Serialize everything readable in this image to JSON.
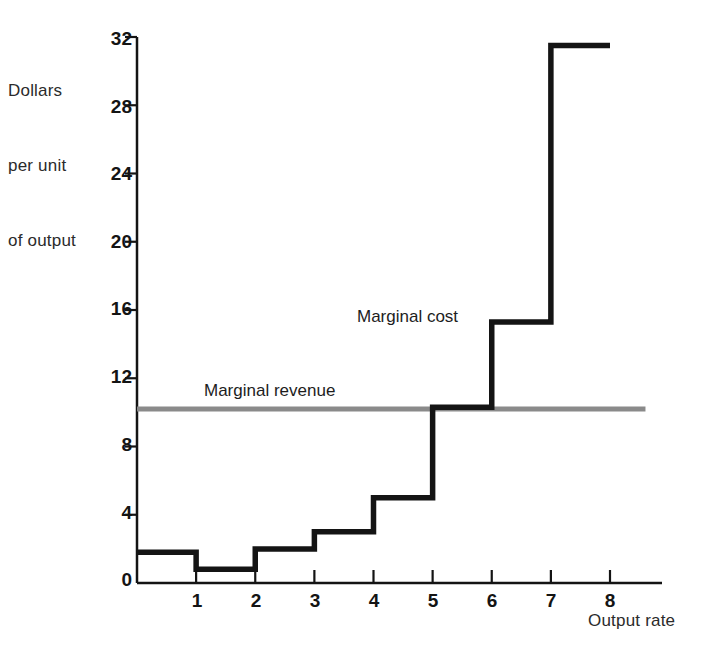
{
  "figure": {
    "background": "#ffffff",
    "ink": "#141414",
    "revenue_color": "#8a8a8a"
  },
  "axes": {
    "y_title_lines": [
      "Dollars",
      "per unit",
      "of output"
    ],
    "x_title": "Output rate",
    "y_ticks": [
      0,
      4,
      8,
      12,
      16,
      20,
      24,
      28,
      32
    ],
    "y_tick_labels": [
      "0",
      "4",
      "8",
      "12",
      "16",
      "20",
      "24",
      "28",
      "32"
    ],
    "x_ticks": [
      1,
      2,
      3,
      4,
      5,
      6,
      7,
      8
    ],
    "x_tick_labels": [
      "1",
      "2",
      "3",
      "4",
      "5",
      "6",
      "7",
      "8"
    ],
    "ylim": [
      0,
      32
    ],
    "xlim": [
      0,
      8.6
    ],
    "grid": "off"
  },
  "annotations": {
    "marginal_cost": "Marginal cost",
    "marginal_revenue": "Marginal revenue"
  },
  "chart_data": {
    "type": "line",
    "title": "",
    "xlabel": "Output rate",
    "ylabel": "Dollars per unit of output",
    "xlim": [
      0,
      8.6
    ],
    "ylim": [
      0,
      32
    ],
    "grid": "off",
    "legend_position": "inline-annotations",
    "series": [
      {
        "name": "Marginal cost",
        "style": "step",
        "color": "#141414",
        "intervals": [
          {
            "from": 0,
            "to": 1,
            "value": 1.8
          },
          {
            "from": 1,
            "to": 2,
            "value": 0.8
          },
          {
            "from": 2,
            "to": 3,
            "value": 2.0
          },
          {
            "from": 3,
            "to": 4,
            "value": 3.0
          },
          {
            "from": 4,
            "to": 5,
            "value": 5.0
          },
          {
            "from": 5,
            "to": 6,
            "value": 10.3
          },
          {
            "from": 6,
            "to": 7,
            "value": 15.3
          },
          {
            "from": 7,
            "to": 8,
            "value": 31.5
          }
        ]
      },
      {
        "name": "Marginal revenue",
        "style": "horizontal-line",
        "color": "#8a8a8a",
        "value": 10.2,
        "from": 0,
        "to": 8.6
      }
    ]
  }
}
